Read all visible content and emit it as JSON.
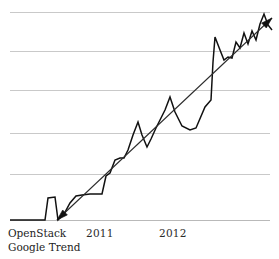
{
  "chart_data": {
    "type": "line",
    "title": "",
    "subtitle": "",
    "xlabel": "",
    "ylabel": "",
    "grid": true,
    "legend_position": "bottom-left",
    "caption_lines": [
      "OpenStack",
      "Google Trend"
    ],
    "x_tick_labels": [
      "2011",
      "2012"
    ],
    "x_tick_positions_px": [
      90,
      163
    ],
    "y_gridlines_px": [
      12,
      51,
      90,
      133,
      174,
      220
    ],
    "axis_ranges": {
      "x_px": [
        10,
        270
      ],
      "y_px": [
        220,
        12
      ]
    },
    "series": [
      {
        "name": "OpenStack Google Trend",
        "style": "zigzag-line",
        "color": "#111111",
        "points_px": [
          [
            10,
            220
          ],
          [
            20,
            220
          ],
          [
            30,
            220
          ],
          [
            40,
            220
          ],
          [
            45,
            220
          ],
          [
            48,
            198
          ],
          [
            55,
            197
          ],
          [
            58,
            220
          ],
          [
            64,
            214
          ],
          [
            70,
            203
          ],
          [
            76,
            196
          ],
          [
            82,
            195
          ],
          [
            90,
            194
          ],
          [
            96,
            194
          ],
          [
            102,
            194
          ],
          [
            106,
            176
          ],
          [
            110,
            173
          ],
          [
            115,
            160
          ],
          [
            120,
            158
          ],
          [
            124,
            158
          ],
          [
            128,
            150
          ],
          [
            133,
            135
          ],
          [
            138,
            122
          ],
          [
            142,
            135
          ],
          [
            147,
            147
          ],
          [
            151,
            139
          ],
          [
            156,
            128
          ],
          [
            160,
            120
          ],
          [
            165,
            110
          ],
          [
            170,
            97
          ],
          [
            175,
            112
          ],
          [
            182,
            126
          ],
          [
            190,
            130
          ],
          [
            196,
            128
          ],
          [
            205,
            107
          ],
          [
            211,
            100
          ],
          [
            213,
            62
          ],
          [
            215,
            37
          ],
          [
            220,
            50
          ],
          [
            224,
            60
          ],
          [
            228,
            57
          ],
          [
            232,
            58
          ],
          [
            236,
            42
          ],
          [
            240,
            48
          ],
          [
            244,
            33
          ],
          [
            248,
            44
          ],
          [
            252,
            31
          ],
          [
            256,
            40
          ],
          [
            260,
            24
          ],
          [
            264,
            14
          ],
          [
            268,
            25
          ],
          [
            272,
            30
          ]
        ]
      }
    ],
    "annotations": [
      {
        "type": "trend-arrow",
        "description": "straight rising trend line with arrowheads at both ends",
        "start_px": [
          57,
          220
        ],
        "end_px": [
          272,
          18
        ],
        "color": "#2b2b2b"
      }
    ]
  }
}
